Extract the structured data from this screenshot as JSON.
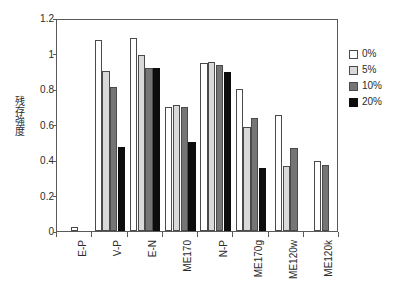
{
  "chart_data": {
    "type": "bar",
    "title": "",
    "xlabel": "",
    "ylabel": "残存強度",
    "ylim": [
      0,
      1.2
    ],
    "ytick_values": [
      0,
      0.2,
      0.4,
      0.6,
      0.8,
      1,
      1.2
    ],
    "ytick_labels": [
      "0",
      "0.2",
      "0.4",
      "0.6",
      "0.8",
      "1",
      "1.2"
    ],
    "grid": false,
    "legend_position": "right",
    "categories": [
      "E-P",
      "V-P",
      "E-N",
      "ME170",
      "N-P",
      "ME170g",
      "ME120w",
      "ME120k"
    ],
    "series": [
      {
        "name": "0%",
        "color": "#ffffff",
        "values": [
          0.02,
          1.075,
          1.085,
          0.7,
          0.945,
          0.8,
          0.655,
          0.395
        ]
      },
      {
        "name": "5%",
        "color": "#d9d9d9",
        "values": [
          null,
          0.9,
          0.99,
          0.71,
          0.955,
          0.585,
          0.365,
          null
        ]
      },
      {
        "name": "10%",
        "color": "#757575",
        "values": [
          null,
          0.81,
          0.92,
          0.7,
          0.935,
          0.635,
          0.47,
          0.37
        ]
      },
      {
        "name": "20%",
        "color": "#0d0d0d",
        "values": [
          null,
          0.475,
          0.92,
          0.5,
          0.895,
          0.355,
          null,
          null
        ]
      }
    ]
  },
  "legend": {
    "items": [
      {
        "label": "0%",
        "swatch_class": "c0"
      },
      {
        "label": "5%",
        "swatch_class": "c5"
      },
      {
        "label": "10%",
        "swatch_class": "c10"
      },
      {
        "label": "20%",
        "swatch_class": "c20"
      }
    ]
  },
  "colors": {
    "series_0": "#ffffff",
    "series_5": "#d9d9d9",
    "series_10": "#757575",
    "series_20": "#0d0d0d",
    "axis": "#5a5a5a",
    "text": "#2b2b2b",
    "background": "#ffffff"
  }
}
